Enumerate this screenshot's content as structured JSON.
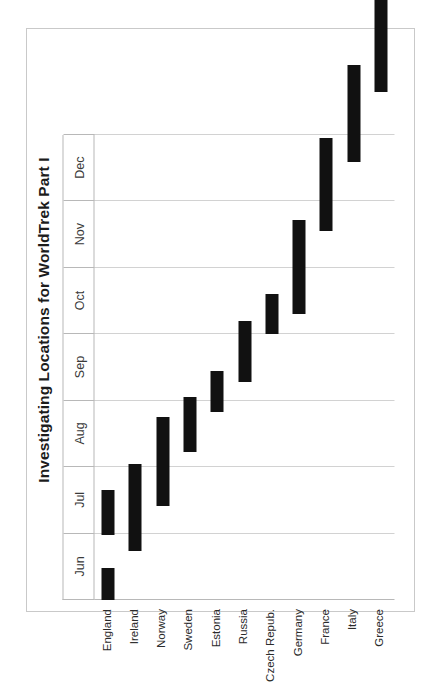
{
  "figure": {
    "title": "Investigating Locations for WorldTrek Part I",
    "orientation": "rotated-90-ccw",
    "bar_color": "#111111",
    "frame_color": "#c9c9c9",
    "axis_color": "#b8b8b8",
    "grid_color": "#d2d2d2"
  },
  "chart_data": {
    "type": "bar",
    "title": "Investigating Locations for WorldTrek Part I",
    "xlabel": "",
    "ylabel": "",
    "grid": true,
    "legend": "none",
    "axis_months": [
      "Jun",
      "Jul",
      "Aug",
      "Sep",
      "Oct",
      "Nov",
      "Dec"
    ],
    "month_axis_range": [
      "Jun",
      "Jan"
    ],
    "categories": [
      "England",
      "Ireland",
      "Norway",
      "Sweden",
      "Estonia",
      "Russia",
      "Czech Repub.",
      "Germany",
      "France",
      "Italy",
      "Greece"
    ],
    "bars": [
      {
        "category": "England",
        "start": "Jun 1",
        "end": "Jun 15",
        "start_value": 0.0,
        "end_value": 0.48
      },
      {
        "category": "England",
        "start": "Jun 26",
        "end": "Jul 19",
        "start_value": 0.98,
        "end_value": 1.65
      },
      {
        "category": "Ireland",
        "start": "Jun 22",
        "end": "Aug 1",
        "start_value": 0.74,
        "end_value": 2.05
      },
      {
        "category": "Norway",
        "start": "Jul 12",
        "end": "Aug 25",
        "start_value": 1.42,
        "end_value": 2.75
      },
      {
        "category": "Sweden",
        "start": "Aug 7",
        "end": "Sep 5",
        "start_value": 2.23,
        "end_value": 3.06
      },
      {
        "category": "Estonia",
        "start": "Aug 27",
        "end": "Sep 18",
        "start_value": 2.83,
        "end_value": 3.45
      },
      {
        "category": "Russia",
        "start": "Sep 12",
        "end": "Oct 12",
        "start_value": 3.28,
        "end_value": 4.2
      },
      {
        "category": "Czech Repub.",
        "start": "Oct 5",
        "end": "Oct 26",
        "start_value": 4.0,
        "end_value": 4.6
      },
      {
        "category": "Germany",
        "start": "Oct 17",
        "end": "Dec 2",
        "start_value": 4.31,
        "end_value": 5.72
      },
      {
        "category": "France",
        "start": "Nov 26",
        "end": "Jan 12",
        "start_value": 5.55,
        "end_value": 6.95
      },
      {
        "category": "Italy",
        "start": "Dec 29",
        "end": "Feb 14",
        "start_value": 6.6,
        "end_value": 8.05
      },
      {
        "category": "Greece",
        "start": "Feb 1",
        "end": "Mar 20",
        "start_value": 7.65,
        "end_value": 9.05
      }
    ]
  },
  "months": [
    {
      "label": "Jun",
      "index": 0
    },
    {
      "label": "Jul",
      "index": 1
    },
    {
      "label": "Aug",
      "index": 2
    },
    {
      "label": "Sep",
      "index": 3
    },
    {
      "label": "Oct",
      "index": 4
    },
    {
      "label": "Nov",
      "index": 5
    },
    {
      "label": "Dec",
      "index": 6
    }
  ],
  "rows": [
    {
      "label": "England",
      "index": 0,
      "bars": [
        [
          0.0,
          0.48
        ],
        [
          0.98,
          1.65
        ]
      ]
    },
    {
      "label": "Ireland",
      "index": 1,
      "bars": [
        [
          0.74,
          2.05
        ]
      ]
    },
    {
      "label": "Norway",
      "index": 2,
      "bars": [
        [
          1.42,
          2.75
        ]
      ]
    },
    {
      "label": "Sweden",
      "index": 3,
      "bars": [
        [
          2.23,
          3.06
        ]
      ]
    },
    {
      "label": "Estonia",
      "index": 4,
      "bars": [
        [
          2.83,
          3.45
        ]
      ]
    },
    {
      "label": "Russia",
      "index": 5,
      "bars": [
        [
          3.28,
          4.2
        ]
      ]
    },
    {
      "label": "Czech Repub.",
      "index": 6,
      "bars": [
        [
          4.0,
          4.6
        ]
      ]
    },
    {
      "label": "Germany",
      "index": 7,
      "bars": [
        [
          4.31,
          5.72
        ]
      ]
    },
    {
      "label": "France",
      "index": 8,
      "bars": [
        [
          5.55,
          6.95
        ]
      ]
    },
    {
      "label": "Italy",
      "index": 9,
      "bars": [
        [
          6.6,
          8.05
        ]
      ]
    },
    {
      "label": "Greece",
      "index": 10,
      "bars": [
        [
          7.65,
          9.05
        ]
      ]
    }
  ]
}
